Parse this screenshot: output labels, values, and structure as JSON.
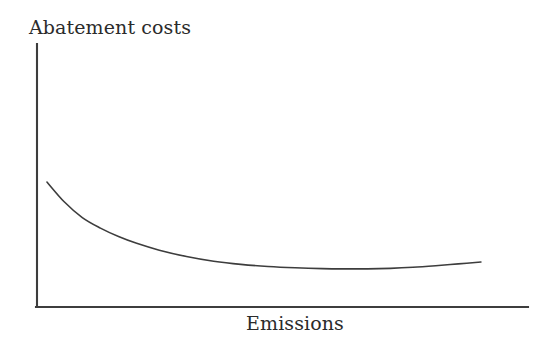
{
  "figure": {
    "background_color": "#ffffff",
    "line_color": "#3d3d3d",
    "axis_color": "#3d3d3d"
  },
  "chart_data": {
    "type": "line",
    "title": "",
    "subtitle": "",
    "xlabel": "Emissions",
    "ylabel": "Abatement costs",
    "legend": [],
    "legend_position": "none",
    "grid": false,
    "axis_ticks": false,
    "tick_labels": {
      "x": [],
      "y": []
    },
    "xlim": [
      0,
      100
    ],
    "ylim": [
      0,
      100
    ],
    "annotations": [],
    "series": [
      {
        "name": "Abatement costs curve",
        "description": "Convex decreasing curve that flattens and turns slightly upward at high emissions",
        "x": [
          2.2,
          6,
          10,
          14,
          18,
          22,
          27,
          33,
          39,
          45,
          51,
          57,
          63,
          68,
          73,
          78,
          83,
          88,
          93,
          98
        ],
        "y": [
          47.5,
          40.0,
          34.0,
          30.0,
          26.8,
          24.2,
          21.6,
          19.2,
          17.4,
          16.2,
          15.4,
          14.9,
          14.6,
          14.5,
          14.5,
          14.7,
          15.1,
          15.7,
          16.4,
          17.1
        ]
      }
    ]
  },
  "labels": {
    "y_axis": "Abatement costs",
    "x_axis": "Emissions"
  }
}
